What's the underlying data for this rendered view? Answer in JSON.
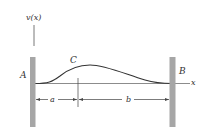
{
  "diagram": {
    "vertical_axis_label": "v(x)",
    "horizontal_axis_label": "x",
    "left_support_label": "A",
    "right_support_label": "B",
    "point_label": "C",
    "dimension_left_label": "a",
    "dimension_right_label": "b",
    "colors": {
      "wall": "#a6a6a6",
      "line": "#333333",
      "axis": "#8c8c8c",
      "background": "#ffffff"
    }
  }
}
